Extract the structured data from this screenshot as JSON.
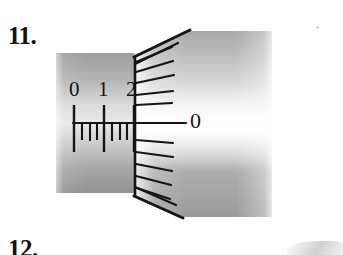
{
  "page": {
    "background_color": "#ffffff",
    "width": 343,
    "height": 255
  },
  "problems": {
    "current_label": "11.",
    "next_label": "12."
  },
  "figure": {
    "name": "micrometer-scale-reading",
    "sleeve": {
      "numerals": [
        "0",
        "1",
        "2"
      ],
      "numeral_positions_mm": [
        0,
        1,
        2
      ],
      "major_tick_count": 3,
      "minor_tick_count": 5,
      "index_line_label": "datum-line"
    },
    "thimble": {
      "index_numeral": "0",
      "tick_count": 11,
      "major_index_tick": "0"
    },
    "colors": {
      "line": "#141414",
      "sleeve_dark": "#9a9a9a",
      "sleeve_mid": "#c9c9c9",
      "sleeve_light": "#efefef",
      "thimble_dark": "#a6a6a6",
      "thimble_mid": "#cfcfcf",
      "thimble_light": "#fdfdfd"
    }
  }
}
